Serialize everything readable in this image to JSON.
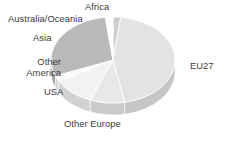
{
  "figure": {
    "background_color": "#ffffff",
    "text_color": "#3b3b3b"
  },
  "labels": {
    "africa": "Africa",
    "australia_oceania": "Australia/Oceania",
    "asia": "Asia",
    "other_america": "Other America",
    "usa": "USA",
    "other_europe": "Other Europe",
    "eu27": "EU27"
  },
  "chart_data": {
    "type": "pie",
    "title": "",
    "subtitle": "",
    "xlabel": "",
    "ylabel": "",
    "grid": false,
    "legend_position": "none",
    "label_placement": "outside-unconnected",
    "three_d": true,
    "depth_px": 12,
    "start_angle_deg": 0,
    "direction": "clockwise",
    "categories": [
      "Africa",
      "EU27",
      "Other Europe",
      "USA",
      "Other America",
      "Asia",
      "Australia/Oceania"
    ],
    "values": [
      2,
      45,
      9,
      11,
      2,
      29,
      2
    ],
    "unit": "percent",
    "slice_colors": [
      "#cfcfcf",
      "#e3e3e3",
      "#e8e8e8",
      "#f2f2f2",
      "#fafafa",
      "#b9b9b9",
      "#ffffff"
    ],
    "slices": [
      {
        "label": "Africa",
        "value": 2,
        "color": "#cfcfcf",
        "side_color": "#b4b4b4"
      },
      {
        "label": "EU27",
        "value": 45,
        "color": "#e3e3e3",
        "side_color": "#c6c6c6"
      },
      {
        "label": "Other Europe",
        "value": 9,
        "color": "#e8e8e8",
        "side_color": "#cacaca"
      },
      {
        "label": "USA",
        "value": 11,
        "color": "#f2f2f2",
        "side_color": "#d2d2d2"
      },
      {
        "label": "Other America",
        "value": 2,
        "color": "#fafafa",
        "side_color": "#d8d8d8"
      },
      {
        "label": "Asia",
        "value": 29,
        "color": "#b9b9b9",
        "side_color": "#9e9e9e"
      },
      {
        "label": "Australia/Oceania",
        "value": 2,
        "color": "#ffffff",
        "side_color": "#dcdcdc"
      }
    ],
    "geometry": {
      "center_x": 113,
      "center_y": 60,
      "radius_x": 62,
      "radius_y": 43
    }
  }
}
